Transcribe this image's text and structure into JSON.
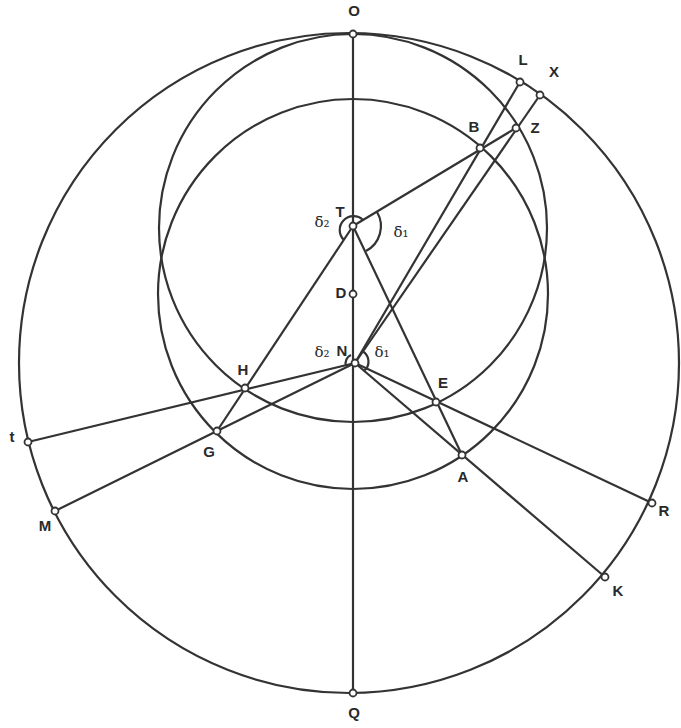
{
  "diagram": {
    "stroke_color": "#333333",
    "background": "#ffffff",
    "circles": [
      {
        "name": "outer-circle",
        "cx": 349,
        "cy": 363,
        "r": 330
      },
      {
        "name": "upper-inner-circle",
        "cx": 353,
        "cy": 228,
        "r": 194
      },
      {
        "name": "lower-inner-circle",
        "cx": 353,
        "cy": 294,
        "r": 195
      }
    ],
    "points": {
      "O": {
        "x": 353,
        "y": 34,
        "lx": 354,
        "ly": 12
      },
      "L": {
        "x": 520,
        "y": 82,
        "lx": 523,
        "ly": 61
      },
      "X": {
        "x": 540,
        "y": 95,
        "lx": 554,
        "ly": 73
      },
      "B": {
        "x": 480,
        "y": 148,
        "lx": 474,
        "ly": 128
      },
      "Z": {
        "x": 516,
        "y": 128,
        "lx": 535,
        "ly": 129
      },
      "T": {
        "x": 353,
        "y": 226,
        "lx": 340,
        "ly": 213
      },
      "D": {
        "x": 353,
        "y": 294,
        "lx": 341,
        "ly": 294
      },
      "N": {
        "x": 355,
        "y": 363,
        "lx": 342,
        "ly": 352
      },
      "H": {
        "x": 245,
        "y": 388,
        "lx": 243,
        "ly": 371
      },
      "E": {
        "x": 436,
        "y": 402,
        "lx": 443,
        "ly": 384
      },
      "t": {
        "x": 28,
        "y": 442,
        "lx": 12,
        "ly": 438
      },
      "G": {
        "x": 217,
        "y": 431,
        "lx": 209,
        "ly": 453
      },
      "A": {
        "x": 462,
        "y": 455,
        "lx": 463,
        "ly": 478
      },
      "M": {
        "x": 55,
        "y": 511,
        "lx": 45,
        "ly": 527
      },
      "R": {
        "x": 652,
        "y": 503,
        "lx": 664,
        "ly": 512
      },
      "K": {
        "x": 605,
        "y": 577,
        "lx": 618,
        "ly": 592
      },
      "Q": {
        "x": 353,
        "y": 693,
        "lx": 354,
        "ly": 714
      }
    },
    "segments": [
      [
        "O",
        "Q"
      ],
      [
        "T",
        "Z"
      ],
      [
        "N",
        "L"
      ],
      [
        "N",
        "X"
      ],
      [
        "T",
        "G"
      ],
      [
        "T",
        "A"
      ],
      [
        "N",
        "t"
      ],
      [
        "N",
        "M"
      ],
      [
        "N",
        "R"
      ],
      [
        "N",
        "K"
      ]
    ],
    "angle_labels": {
      "T_delta2": {
        "text": "δ̄2",
        "x": 322,
        "y": 223
      },
      "T_delta1": {
        "text": "δ̄1",
        "x": 401,
        "y": 233
      },
      "N_delta2": {
        "text": "δ2",
        "x": 322,
        "y": 353
      },
      "N_delta1": {
        "text": "δ1",
        "x": 382,
        "y": 353
      }
    },
    "labels": {
      "O": "O",
      "L": "L",
      "X": "X",
      "B": "B",
      "Z": "Z",
      "T": "T",
      "D": "D",
      "N": "N",
      "H": "H",
      "E": "E",
      "t": "t",
      "G": "G",
      "A": "A",
      "M": "M",
      "R": "R",
      "K": "K",
      "Q": "Q",
      "delta_bar_2": "δ̄₂",
      "delta_bar_1": "δ̄₁",
      "delta_2": "δ₂",
      "delta_1": "δ₁"
    }
  }
}
